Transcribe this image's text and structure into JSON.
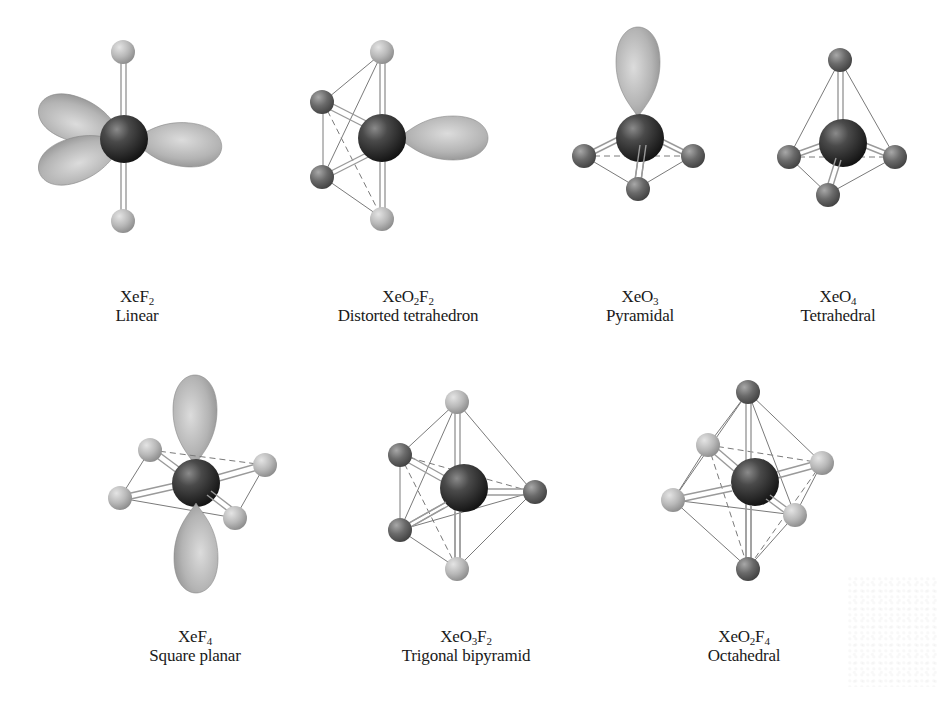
{
  "figure": {
    "colors": {
      "central_atom": "#2a2a2a",
      "fluorine_atom": "#bdbdbd",
      "oxygen_atom": "#6e6e6e",
      "lone_pair_lobe": "#b5b5b5",
      "bond": "#9a9a9a",
      "edge_line": "#7a7a7a",
      "background": "#ffffff"
    },
    "molecules": [
      {
        "id": "xef2",
        "formula_parts": [
          "XeF",
          "2",
          ""
        ],
        "formula": "XeF2",
        "geometry": "Linear",
        "row": 1
      },
      {
        "id": "xeo2f2",
        "formula_parts": [
          "XeO",
          "2",
          "F",
          "2"
        ],
        "formula": "XeO2F2",
        "geometry": "Distorted tetrahedron",
        "row": 1
      },
      {
        "id": "xeo3",
        "formula_parts": [
          "XeO",
          "3"
        ],
        "formula": "XeO3",
        "geometry": "Pyramidal",
        "row": 1
      },
      {
        "id": "xeo4",
        "formula_parts": [
          "XeO",
          "4"
        ],
        "formula": "XeO4",
        "geometry": "Tetrahedral",
        "row": 1
      },
      {
        "id": "xef4",
        "formula_parts": [
          "XeF",
          "4"
        ],
        "formula": "XeF4",
        "geometry": "Square planar",
        "row": 2
      },
      {
        "id": "xeo3f2",
        "formula_parts": [
          "XeO",
          "3",
          "F",
          "2"
        ],
        "formula": "XeO3F2",
        "geometry": "Trigonal bipyramid",
        "row": 2
      },
      {
        "id": "xeo2f4",
        "formula_parts": [
          "XeO",
          "2",
          "F",
          "4"
        ],
        "formula": "XeO2F4",
        "geometry": "Octahedral",
        "row": 2
      }
    ]
  }
}
